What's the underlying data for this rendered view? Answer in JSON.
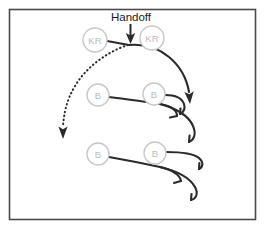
{
  "diagram": {
    "title": "Handoff",
    "frame": {
      "border_color": "#4a4a4a",
      "background_color": "#ffffff"
    },
    "colors": {
      "player_outline": "#c8c8c8",
      "player_text": "#bdbdbd",
      "route_line": "#2b2b2b",
      "label_text": "#1a1a1a"
    },
    "annotation": {
      "handoff_label": "Handoff"
    },
    "players": [
      {
        "id": "kr-left",
        "label": "KR",
        "cx": 95,
        "cy": 40,
        "r": 12
      },
      {
        "id": "kr-right",
        "label": "KR",
        "cx": 152,
        "cy": 38,
        "r": 12
      },
      {
        "id": "b-mid-left",
        "label": "B",
        "cx": 98,
        "cy": 95,
        "r": 11
      },
      {
        "id": "b-mid-right",
        "label": "B",
        "cx": 154,
        "cy": 94,
        "r": 11
      },
      {
        "id": "b-bottom-left",
        "label": "B",
        "cx": 98,
        "cy": 154,
        "r": 11
      },
      {
        "id": "b-bottom-right",
        "label": "B",
        "cx": 155,
        "cy": 153,
        "r": 11
      }
    ],
    "routes": [
      {
        "id": "handoff-motion-dotted",
        "style": "dotted",
        "ends_with": "arrowhead"
      },
      {
        "id": "kr-carry-solid",
        "style": "solid",
        "ends_with": "arrowhead"
      },
      {
        "id": "blocker-route-1",
        "style": "solid",
        "ends_with": "hook-tick"
      },
      {
        "id": "blocker-route-2",
        "style": "solid",
        "ends_with": "hook-tick"
      },
      {
        "id": "blocker-route-3",
        "style": "solid",
        "ends_with": "hook-tick"
      },
      {
        "id": "blocker-route-4",
        "style": "solid",
        "ends_with": "hook-tick"
      }
    ]
  }
}
